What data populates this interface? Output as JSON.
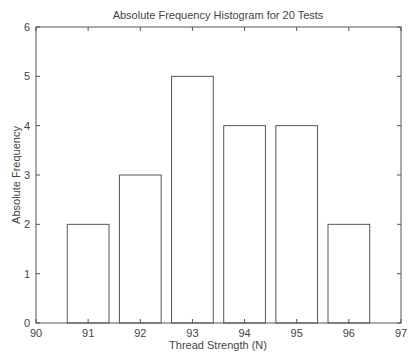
{
  "chart_data": {
    "type": "bar",
    "title": "Absolute Frequency Histogram for 20 Tests",
    "xlabel": "Thread Strength (N)",
    "ylabel": "Absolute Frequency",
    "categories": [
      "91",
      "92",
      "93",
      "94",
      "95",
      "96"
    ],
    "x": [
      91,
      92,
      93,
      94,
      95,
      96
    ],
    "values": [
      2,
      3,
      5,
      4,
      4,
      2
    ],
    "bar_width": 0.8,
    "xlim": [
      90,
      97
    ],
    "ylim": [
      0,
      6
    ],
    "xticks": [
      "90",
      "91",
      "92",
      "93",
      "94",
      "95",
      "96",
      "97"
    ],
    "yticks": [
      "0",
      "1",
      "2",
      "3",
      "4",
      "5",
      "6"
    ],
    "grid": false,
    "legend": null,
    "colors": {
      "bar_fill": "#ffffff",
      "bar_edge": "#555555",
      "axis": "#555555"
    }
  }
}
